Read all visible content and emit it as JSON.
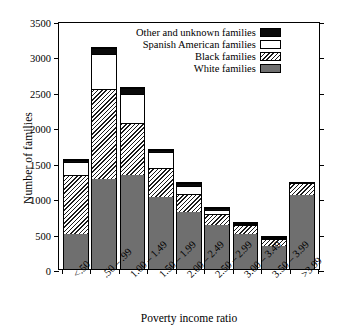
{
  "chart_data": {
    "type": "bar",
    "subtype": "stacked-vertical-histogram",
    "title": "",
    "xlabel": "Poverty income ratio",
    "ylabel": "Number of families",
    "ylim": [
      0,
      3500
    ],
    "yticks": [
      0,
      500,
      1000,
      1500,
      2000,
      2500,
      3000,
      3500
    ],
    "ytick_labels": [
      "0",
      "500",
      "1000",
      "1500",
      "2000",
      "2500",
      "3000",
      "3500"
    ],
    "grid": false,
    "legend_position": "top-right-inside",
    "categories": [
      "<.50",
      ".50 – .99",
      "1.00 – 1.49",
      "1.50 – 1.99",
      "2.00 – 2.49",
      "2.50 – 2.99",
      "3.00 – 3.49",
      "3.50 – 3.99",
      ">3.99"
    ],
    "series": [
      {
        "name": "White families",
        "key": "white",
        "swatch": "gray-solid",
        "color": "#6f6f6f",
        "values": [
          500,
          1270,
          1320,
          1010,
          800,
          615,
          495,
          320,
          1040
        ]
      },
      {
        "name": "Black families",
        "key": "black",
        "swatch": "diagonal-hatch",
        "color": "#ffffff",
        "values": [
          830,
          1270,
          735,
          410,
          265,
          165,
          120,
          105,
          170
        ]
      },
      {
        "name": "Spanish American families",
        "key": "spanish",
        "swatch": "white-empty",
        "color": "#ffffff",
        "values": [
          180,
          490,
          415,
          230,
          110,
          55,
          10,
          5,
          0
        ]
      },
      {
        "name": "Other and unknown families",
        "key": "other",
        "swatch": "black-solid",
        "color": "#0a0a0a",
        "values": [
          25,
          90,
          90,
          25,
          40,
          25,
          10,
          5,
          0
        ]
      }
    ],
    "totals": [
      1535,
      3120,
      2560,
      1675,
      1215,
      860,
      635,
      435,
      1210
    ]
  },
  "legend": {
    "entries": [
      {
        "label": "Other and unknown families",
        "swatch_class": "sw-other"
      },
      {
        "label": "Spanish American families",
        "swatch_class": "sw-spanish"
      },
      {
        "label": "Black families",
        "swatch_class": "sw-black"
      },
      {
        "label": "White families",
        "swatch_class": "sw-white"
      }
    ]
  }
}
